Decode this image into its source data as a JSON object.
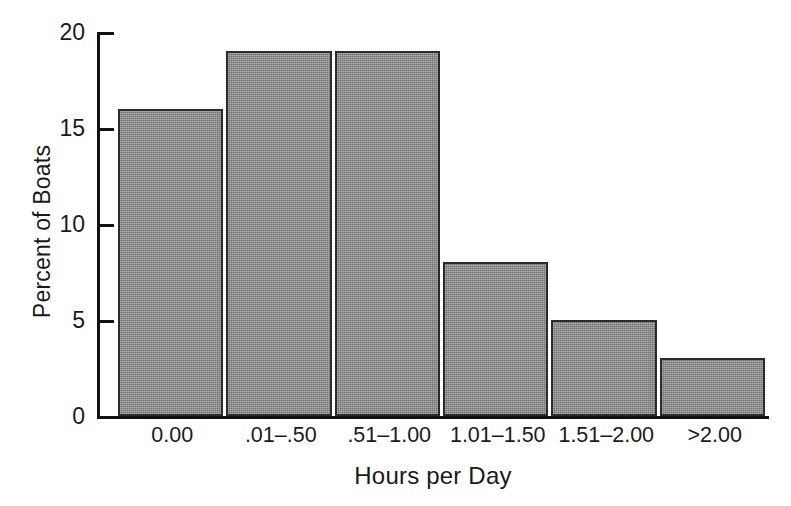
{
  "chart_data": {
    "type": "bar",
    "title": "",
    "xlabel": "Hours per Day",
    "ylabel": "Percent of Boats",
    "categories": [
      "0.00",
      ".01–.50",
      ".51–1.00",
      "1.01–1.50",
      "1.51–2.00",
      ">2.00"
    ],
    "values": [
      16,
      19,
      19,
      8,
      5,
      3
    ],
    "ylim": [
      0,
      20
    ],
    "yticks": [
      0,
      5,
      10,
      15,
      20
    ],
    "ytick_labels": [
      "0",
      "5",
      "10",
      "15",
      "20"
    ],
    "grid": false,
    "legend": false,
    "bar_fill_color": "#8d8d8d",
    "bar_edge_color": "#2b2b2b",
    "axis_color": "#111111",
    "background_color": "#ffffff"
  },
  "axes": {
    "y_title": "Percent of Boats",
    "x_title": "Hours per Day",
    "y_tick_0": "0",
    "y_tick_1": "5",
    "y_tick_2": "10",
    "y_tick_3": "15",
    "y_tick_4": "20",
    "x_tick_0": "0.00",
    "x_tick_1": ".01–.50",
    "x_tick_2": ".51–1.00",
    "x_tick_3": "1.01–1.50",
    "x_tick_4": "1.51–2.00",
    "x_tick_5": ">2.00"
  }
}
